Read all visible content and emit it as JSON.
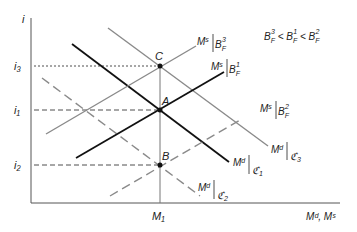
{
  "axes": {
    "y_label": "i",
    "x_label": "Mᵈ, Mˢ",
    "x_tick": "M₁",
    "y_ticks": [
      "i₃",
      "i₁",
      "i₂"
    ]
  },
  "points": {
    "C": "C",
    "A": "A",
    "B": "B"
  },
  "curves": {
    "ms_b3": {
      "base": "Mˢ",
      "sub": "B",
      "sub_sub": "F",
      "sup": "3"
    },
    "ms_b1": {
      "base": "Mˢ",
      "sub": "B",
      "sub_sub": "F",
      "sup": "1"
    },
    "ms_b2": {
      "base": "Mˢ",
      "sub": "B",
      "sub_sub": "F",
      "sup": "2"
    },
    "md_c3": {
      "base": "Mᵈ",
      "sub": "ℭ",
      "sub_sub": "3"
    },
    "md_c1": {
      "base": "Mᵈ",
      "sub": "ℭ",
      "sub_sub": "1"
    },
    "md_c2": {
      "base": "Mᵈ",
      "sub": "ℭ",
      "sub_sub": "2"
    }
  },
  "inequality": "B³F < B¹F < B²F",
  "colors": {
    "black": "#111111",
    "gray": "#8a8a8a"
  }
}
